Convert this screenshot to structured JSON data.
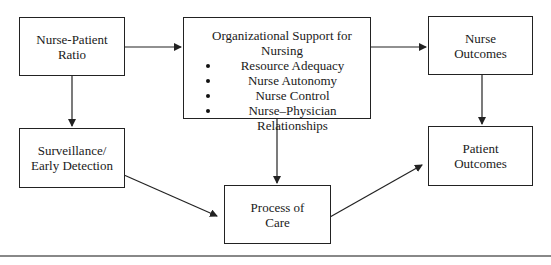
{
  "diagram": {
    "nodes": {
      "nurse_patient_ratio": {
        "line1": "Nurse-Patient",
        "line2": "Ratio"
      },
      "org_support": {
        "title": "Organizational Support for Nursing",
        "bullets": [
          "Resource Adequacy",
          "Nurse Autonomy",
          "Nurse Control",
          "Nurse–Physician Relationships"
        ]
      },
      "nurse_outcomes": {
        "line1": "Nurse",
        "line2": "Outcomes"
      },
      "surveillance": {
        "line1": "Surveillance/",
        "line2": "Early Detection"
      },
      "process_of_care": {
        "line1": "Process of",
        "line2": "Care"
      },
      "patient_outcomes": {
        "line1": "Patient",
        "line2": "Outcomes"
      }
    },
    "edges": [
      {
        "from": "Nurse-Patient Ratio",
        "to": "Organizational Support for Nursing"
      },
      {
        "from": "Nurse-Patient Ratio",
        "to": "Surveillance/Early Detection"
      },
      {
        "from": "Organizational Support for Nursing",
        "to": "Nurse Outcomes"
      },
      {
        "from": "Organizational Support for Nursing",
        "to": "Process of Care"
      },
      {
        "from": "Surveillance/Early Detection",
        "to": "Process of Care"
      },
      {
        "from": "Process of Care",
        "to": "Patient Outcomes"
      },
      {
        "from": "Nurse Outcomes",
        "to": "Patient Outcomes"
      }
    ],
    "colors": {
      "line": "#222222",
      "rule": "#888888",
      "background": "#ffffff"
    }
  }
}
